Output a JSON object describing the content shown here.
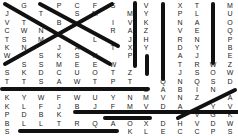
{
  "puzzle": {
    "type": "word-search",
    "columns_x": [
      7,
      24,
      41,
      59,
      77,
      95,
      113,
      130,
      146,
      163,
      180,
      197,
      213,
      230
    ],
    "rows_y": [
      5,
      14,
      23,
      32,
      41,
      50,
      58,
      67,
      76,
      85,
      94,
      103,
      112,
      121,
      130,
      134
    ],
    "grid": [
      [
        "",
        "G",
        "",
        "P",
        "C",
        "F",
        "S",
        "",
        "V",
        "",
        "X",
        "T",
        "",
        "M"
      ],
      [
        "J",
        "",
        "T",
        "",
        "S",
        "M",
        "",
        "M",
        "Y",
        "",
        "P",
        "L",
        "",
        "U"
      ],
      [
        "V",
        "T",
        "",
        "B",
        "",
        "",
        "I",
        "V",
        "K",
        "",
        "N",
        "A",
        "",
        "O"
      ],
      [
        "C",
        "W",
        "N",
        "",
        "",
        "",
        "R",
        "A",
        "Z",
        "",
        "V",
        "E",
        "",
        "Q"
      ],
      [
        "T",
        "S",
        "M",
        "",
        "",
        "L",
        "",
        "J",
        "H",
        "",
        "R",
        "N",
        "",
        "P"
      ],
      [
        "K",
        "N",
        "",
        "J",
        "A",
        "",
        "T",
        "X",
        "Y",
        "",
        "D",
        "Y",
        "",
        "B"
      ],
      [
        "W",
        "",
        "S",
        "K",
        "S",
        "H",
        "",
        "P",
        "",
        "",
        "A",
        "J",
        "",
        "E"
      ],
      [
        "",
        "S",
        "S",
        "M",
        "E",
        "E",
        "W",
        "",
        "",
        "",
        "T",
        "R",
        "W",
        "Z"
      ],
      [
        "S",
        "K",
        "D",
        "C",
        "U",
        "O",
        "T",
        "Z",
        "",
        "",
        "J",
        "S",
        "O",
        "W"
      ],
      [
        "T",
        "T",
        "S",
        "A",
        "W",
        "T",
        "P",
        "T",
        "",
        "Q",
        "N",
        "Q",
        "S",
        "D"
      ],
      [
        "",
        "",
        "",
        "",
        "",
        "",
        "",
        "",
        "O",
        "A",
        "B",
        "I",
        "N",
        ""
      ],
      [
        "K",
        "Y",
        "W",
        "F",
        "W",
        "U",
        "Y",
        "N",
        "M",
        "V",
        "N",
        "Z",
        "",
        "A"
      ],
      [
        "K",
        "L",
        "F",
        "J",
        "B",
        "J",
        "F",
        "M",
        "V",
        "D",
        "A",
        "",
        "Y",
        "V"
      ],
      [
        "P",
        "D",
        "B",
        "K",
        "",
        "",
        "",
        "",
        "",
        "",
        "",
        "V",
        "G",
        "K"
      ],
      [
        "B",
        "L",
        "L",
        "T",
        "R",
        "Q",
        "A",
        "O",
        "X",
        "D",
        "H",
        "V",
        "D",
        "W"
      ],
      [
        "S",
        "",
        "",
        "",
        "",
        "",
        "",
        "K",
        "L",
        "E",
        "C",
        "C",
        "P",
        "S"
      ]
    ],
    "found_word_strikes": [
      {
        "x1": 5,
        "y1": 4,
        "x2": 110,
        "y2": 64
      },
      {
        "x1": 40,
        "y1": 4,
        "x2": 118,
        "y2": 46
      },
      {
        "x1": 5,
        "y1": 64,
        "x2": 112,
        "y2": 4
      },
      {
        "x1": 2,
        "y1": 89,
        "x2": 148,
        "y2": 89
      },
      {
        "x1": 135,
        "y1": 3,
        "x2": 135,
        "y2": 66
      },
      {
        "x1": 163,
        "y1": 4,
        "x2": 163,
        "y2": 79
      },
      {
        "x1": 213,
        "y1": 4,
        "x2": 213,
        "y2": 63
      },
      {
        "x1": 147,
        "y1": 56,
        "x2": 147,
        "y2": 74
      },
      {
        "x1": 75,
        "y1": 112,
        "x2": 238,
        "y2": 112
      },
      {
        "x1": 20,
        "y1": 131,
        "x2": 117,
        "y2": 131
      },
      {
        "x1": 178,
        "y1": 118,
        "x2": 235,
        "y2": 90
      },
      {
        "x1": 105,
        "y1": 118,
        "x2": 150,
        "y2": 118
      }
    ],
    "strike_color": "#111111"
  }
}
